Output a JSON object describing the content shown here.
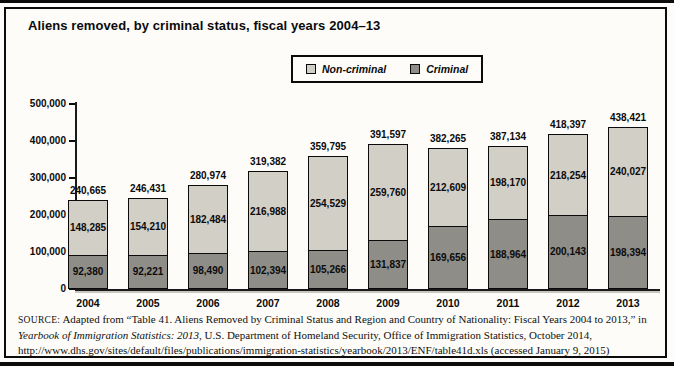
{
  "title": "Aliens removed, by criminal status, fiscal years 2004–13",
  "colors": {
    "non_criminal": "#d2cfc7",
    "criminal": "#8e8d88",
    "text": "#0b0b0b",
    "frame_background": "#fdfcf8",
    "axis_shadow": "#c9c7c0"
  },
  "legend": {
    "items": [
      {
        "label": "Non-criminal",
        "color_key": "non_criminal"
      },
      {
        "label": "Criminal",
        "color_key": "criminal"
      }
    ]
  },
  "chart_data": {
    "type": "bar",
    "stacked": true,
    "title": "Aliens removed, by criminal status, fiscal years 2004–13",
    "xlabel": "",
    "ylabel": "",
    "categories": [
      "2004",
      "2005",
      "2006",
      "2007",
      "2008",
      "2009",
      "2010",
      "2011",
      "2012",
      "2013"
    ],
    "series": [
      {
        "name": "Non-criminal",
        "color_key": "non_criminal",
        "values": [
          148285,
          154210,
          182484,
          216988,
          254529,
          259760,
          212609,
          198170,
          218254,
          240027
        ]
      },
      {
        "name": "Criminal",
        "color_key": "criminal",
        "values": [
          92380,
          92221,
          98490,
          102394,
          105266,
          131837,
          169656,
          188964,
          200143,
          198394
        ]
      }
    ],
    "totals": [
      240665,
      246431,
      280974,
      319382,
      359795,
      391597,
      382265,
      387134,
      418397,
      438421
    ],
    "ylim": [
      0,
      500000
    ],
    "yticks": [
      0,
      100000,
      200000,
      300000,
      400000,
      500000
    ],
    "ytick_labels": [
      "0",
      "100,000",
      "200,000",
      "300,000",
      "400,000",
      "500,000"
    ],
    "grid": false,
    "legend_position": "top-center"
  },
  "source": {
    "label": "SOURCE:",
    "part1": " Adapted from “Table 41. Aliens Removed by Criminal Status and Region and Country of Nationality: Fiscal Years 2004 to 2013,” in ",
    "italic": "Yearbook of Immigration Statistics: 2013",
    "part2": ", U.S. Department of Homeland Security, Office of Immigration Statistics, October 2014, http://www.dhs.gov/sites/default/files/publications/immigration-statistics/yearbook/2013/ENF/table41d.xls (accessed January 9, 2015)"
  }
}
